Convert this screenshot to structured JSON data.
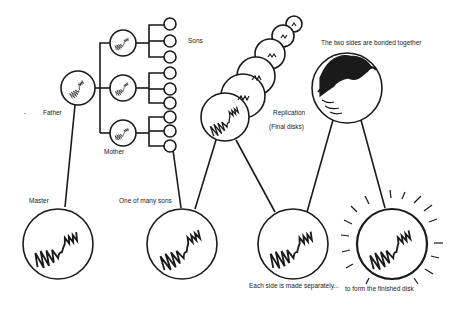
{
  "diagram": {
    "labels": {
      "sons": "Sons",
      "father": "Father",
      "mother": "Mother",
      "master": "Master",
      "one_of_many_sons": "One of many sons",
      "replication": "Replication",
      "final_disks": "(Final disks)",
      "bonded": "The two sides are bonded together",
      "each_side": "Each side is made separately...",
      "finished": "to form the finished disk",
      "dash": "-"
    },
    "nodes": [
      {
        "id": "master",
        "label": "Master"
      },
      {
        "id": "father",
        "label": "Father"
      },
      {
        "id": "mother-1",
        "label": "Mother"
      },
      {
        "id": "mother-2",
        "label": "Mother"
      },
      {
        "id": "mother-3",
        "label": "Mother"
      },
      {
        "id": "sons",
        "label": "Sons",
        "count": 9
      },
      {
        "id": "son",
        "label": "One of many sons"
      },
      {
        "id": "replication",
        "label": "Replication (Final disks)",
        "count": 6
      },
      {
        "id": "side",
        "label": "Each side is made separately..."
      },
      {
        "id": "bonded",
        "label": "The two sides are bonded together"
      },
      {
        "id": "finished",
        "label": "to form the finished disk"
      }
    ],
    "colors": {
      "ink": "#1a1a1a",
      "background": "#ffffff"
    }
  }
}
